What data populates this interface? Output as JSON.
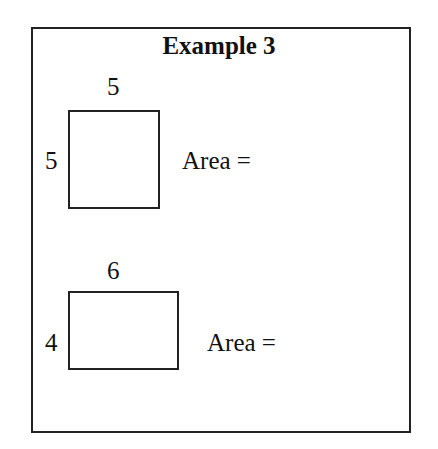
{
  "title": "Example 3",
  "figures": [
    {
      "shape": "square",
      "top_label": "5",
      "side_label": "5",
      "area_label": "Area ="
    },
    {
      "shape": "rectangle",
      "top_label": "6",
      "side_label": "4",
      "area_label": "Area ="
    }
  ]
}
